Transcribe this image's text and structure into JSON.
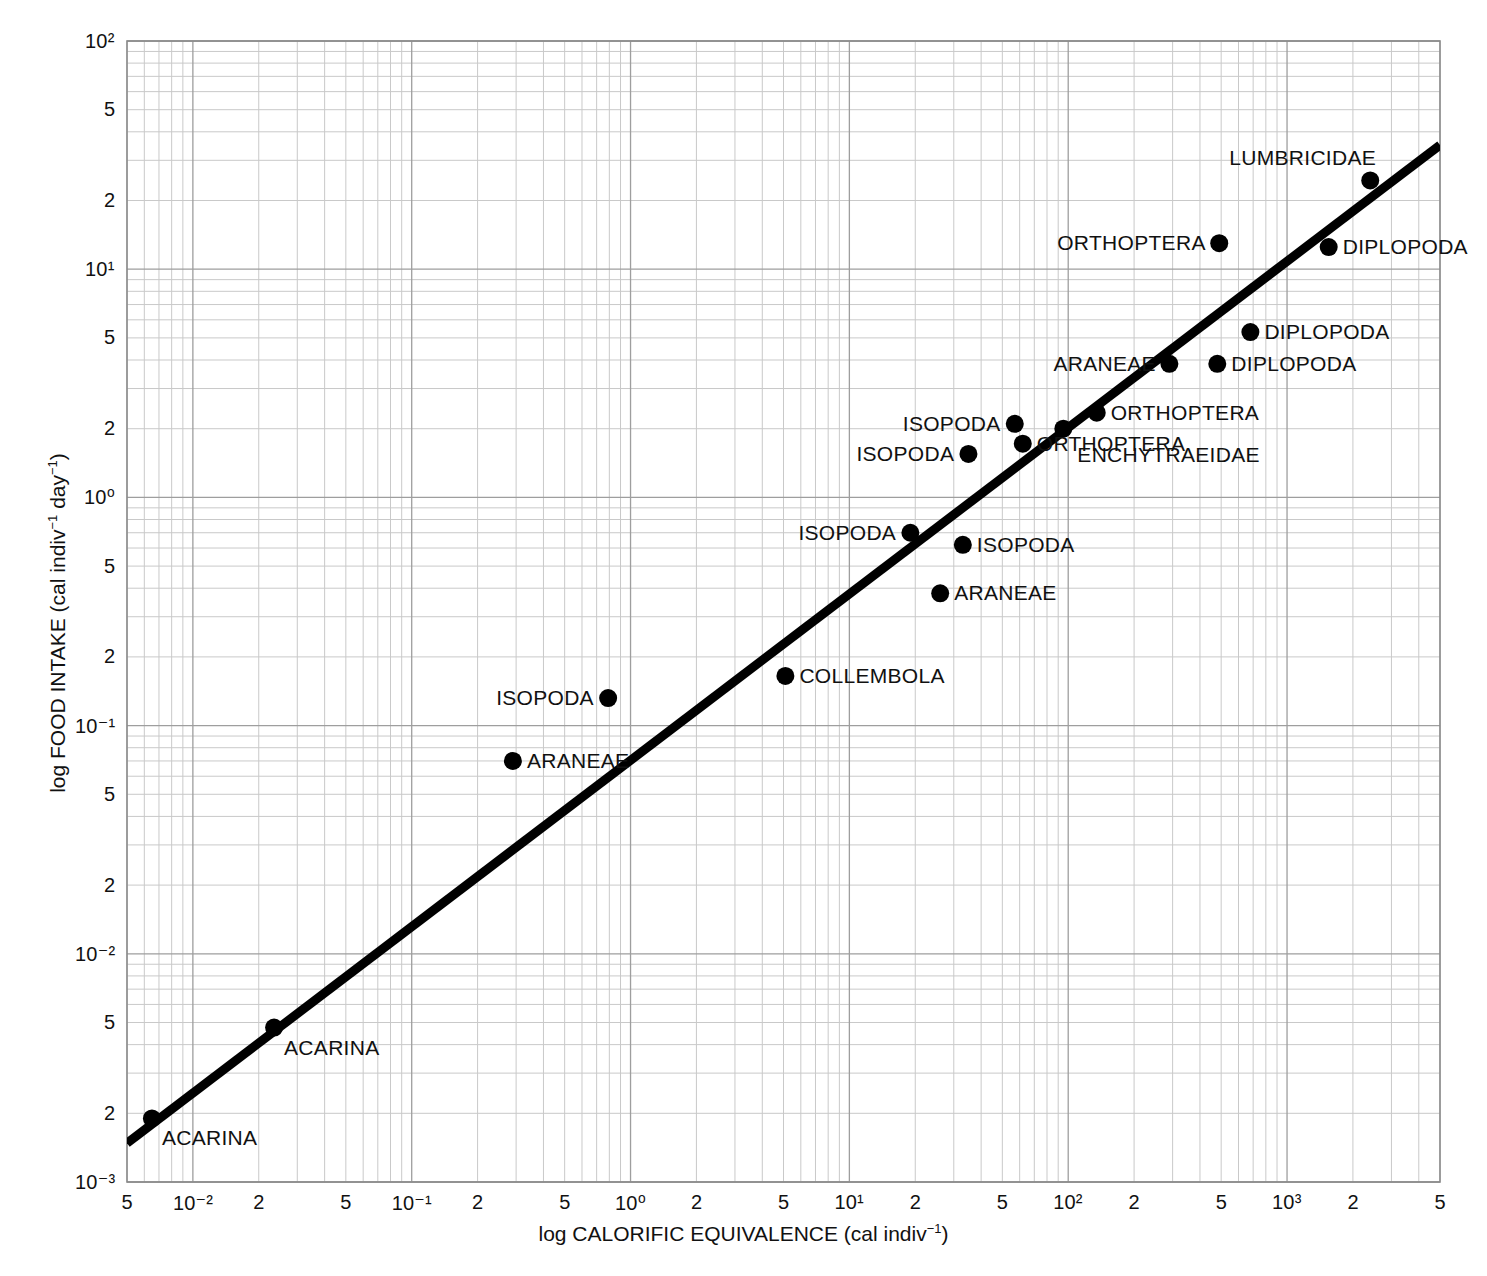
{
  "figure": {
    "kind": "scientific-scatter-plot",
    "background": "#ffffff",
    "ink_color": "#000000",
    "grid_color": "#bdbdbd"
  },
  "chart_data": {
    "type": "scatter",
    "title": "",
    "xlabel": "log CALORIFIC EQUIVALENCE (cal indiv−1)",
    "ylabel": "log FOOD INTAKE (cal indiv−1 day−1)",
    "xscale": "log",
    "yscale": "log",
    "xlim": [
      0.005,
      5000
    ],
    "ylim": [
      0.001,
      100
    ],
    "grid": true,
    "grid_style": "log-log minor gridlines (1-9 per decade)",
    "legend": "none (points labelled inline)",
    "x_tick_labels": [
      "5",
      "10⁻²",
      "2",
      "5",
      "10⁻¹",
      "2",
      "5",
      "10⁰",
      "2",
      "5",
      "10¹",
      "2",
      "5",
      "10²",
      "2",
      "5",
      "10³",
      "2",
      "5"
    ],
    "x_tick_values": [
      0.005,
      0.01,
      0.02,
      0.05,
      0.1,
      0.2,
      0.5,
      1,
      2,
      5,
      10,
      20,
      50,
      100,
      200,
      500,
      1000,
      2000,
      5000
    ],
    "y_tick_labels": [
      "10²",
      "5",
      "2",
      "10¹",
      "5",
      "2",
      "10⁰",
      "5",
      "2",
      "10⁻¹",
      "5",
      "2",
      "10⁻²",
      "5",
      "2",
      "10⁻³"
    ],
    "y_tick_values": [
      100,
      50,
      20,
      10,
      5,
      2,
      1,
      0.5,
      0.2,
      0.1,
      0.05,
      0.02,
      0.01,
      0.005,
      0.002,
      0.001
    ],
    "fit_line": {
      "label": "regression line",
      "x_start": 0.005,
      "y_start": 0.00148,
      "x_end": 5000,
      "y_end": 35.0,
      "slope_loglog": 0.787,
      "stroke_width_px": 9
    },
    "points": [
      {
        "name": "ACARINA",
        "x": 0.0065,
        "y": 0.0019,
        "label": "ACARINA",
        "label_pos": "below-right"
      },
      {
        "name": "ACARINA",
        "x": 0.0235,
        "y": 0.00475,
        "label": "ACARINA",
        "label_pos": "below-right"
      },
      {
        "name": "ARANEAE",
        "x": 0.29,
        "y": 0.07,
        "label": "ARANEAE",
        "label_pos": "right"
      },
      {
        "name": "ISOPODA",
        "x": 0.79,
        "y": 0.132,
        "label": "ISOPODA",
        "label_pos": "left"
      },
      {
        "name": "COLLEMBOLA",
        "x": 5.1,
        "y": 0.165,
        "label": "COLLEMBOLA",
        "label_pos": "right"
      },
      {
        "name": "ARANEAE",
        "x": 26.0,
        "y": 0.38,
        "label": "ARANEAE",
        "label_pos": "right"
      },
      {
        "name": "ISOPODA",
        "x": 19.0,
        "y": 0.7,
        "label": "ISOPODA",
        "label_pos": "left"
      },
      {
        "name": "ISOPODA",
        "x": 33.0,
        "y": 0.62,
        "label": "ISOPODA",
        "label_pos": "right"
      },
      {
        "name": "ISOPODA",
        "x": 35.0,
        "y": 1.55,
        "label": "ISOPODA",
        "label_pos": "left"
      },
      {
        "name": "ISOPODA",
        "x": 57.0,
        "y": 2.1,
        "label": "ISOPODA",
        "label_pos": "left"
      },
      {
        "name": "ORTHOPTERA",
        "x": 62.0,
        "y": 1.72,
        "label": "ORTHOPTERA",
        "label_pos": "right"
      },
      {
        "name": "ENCHYTRAEIDAE",
        "x": 95.0,
        "y": 2.0,
        "label": "ENCHYTRAEIDAE",
        "label_pos": "right-lower"
      },
      {
        "name": "ORTHOPTERA",
        "x": 135.0,
        "y": 2.35,
        "label": "ORTHOPTERA",
        "label_pos": "right"
      },
      {
        "name": "ARANEAE",
        "x": 290.0,
        "y": 3.85,
        "label": "ARANEAE",
        "label_pos": "left"
      },
      {
        "name": "DIPLOPODA",
        "x": 480.0,
        "y": 3.85,
        "label": "DIPLOPODA",
        "label_pos": "right"
      },
      {
        "name": "DIPLOPODA",
        "x": 680.0,
        "y": 5.3,
        "label": "DIPLOPODA",
        "label_pos": "right"
      },
      {
        "name": "ORTHOPTERA",
        "x": 490.0,
        "y": 13.0,
        "label": "ORTHOPTERA",
        "label_pos": "left"
      },
      {
        "name": "DIPLOPODA",
        "x": 1550.0,
        "y": 12.5,
        "label": "DIPLOPODA",
        "label_pos": "right"
      },
      {
        "name": "LUMBRICIDAE",
        "x": 2400.0,
        "y": 24.5,
        "label": "LUMBRICIDAE",
        "label_pos": "above-left"
      }
    ]
  },
  "axes": {
    "x_title": "log CALORIFIC EQUIVALENCE (cal indiv",
    "x_title_sup": "−1",
    "x_title_tail": ")",
    "y_title": "log FOOD INTAKE (cal indiv",
    "y_title_sup1": "−1",
    "y_title_mid": " day",
    "y_title_sup2": "−1",
    "y_title_tail": ")"
  }
}
